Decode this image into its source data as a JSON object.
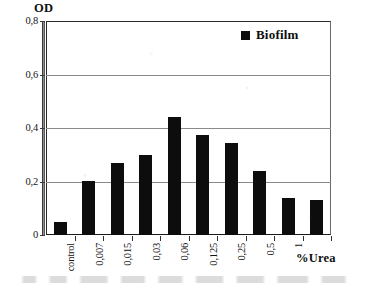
{
  "chart_data": {
    "type": "bar",
    "title": "",
    "xlabel": "%Urea",
    "ylabel": "OD",
    "ylim": [
      0,
      0.8
    ],
    "ytick_step": 0.2,
    "ytick_labels": [
      "0,8",
      "0,6",
      "0,4",
      "0,2",
      "0"
    ],
    "ytick_values": [
      0.8,
      0.6,
      0.4,
      0.2,
      0
    ],
    "grid": true,
    "legend_position": "top-right",
    "decimal_separator": ",",
    "categories": [
      "control",
      "0,007",
      "0,015",
      "0,03",
      "0,06",
      "0,125",
      "0,25",
      "0,5",
      "1",
      ""
    ],
    "series": [
      {
        "name": "Biofilm",
        "color": "#0d0d0d",
        "values": [
          0.05,
          0.2,
          0.27,
          0.3,
          0.44,
          0.375,
          0.345,
          0.24,
          0.14,
          0.13
        ]
      }
    ],
    "legend": [
      {
        "label": "Biofilm",
        "swatch": "legend-swatch-square",
        "color": "#0d0d0d"
      }
    ],
    "colors": {
      "bar": "#0d0d0d",
      "gridline": "#8a8a8a",
      "axis": "#2a2a2a",
      "background": "#ffffff",
      "text": "#111111"
    }
  }
}
